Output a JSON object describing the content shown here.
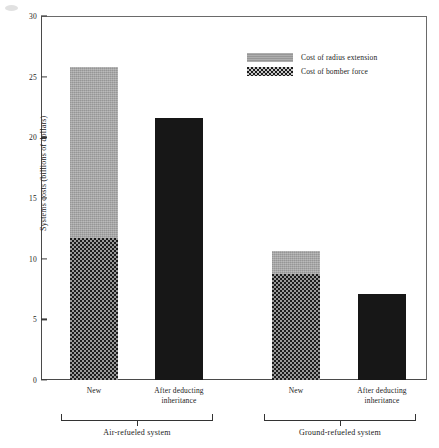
{
  "chart_data": {
    "type": "bar",
    "subtype": "stacked-grouped",
    "title": "",
    "xlabel": "",
    "ylabel": "Systems costs (billions of dollars)",
    "ylim": [
      0,
      30
    ],
    "yticks": [
      0,
      5,
      10,
      15,
      20,
      25,
      30
    ],
    "ytick_labels": [
      "0",
      "5",
      "10",
      "15",
      "20",
      "25",
      "30"
    ],
    "grid": false,
    "legend_position": "upper-center-right",
    "categories": [
      "New",
      "After deducting inheritance",
      "New",
      "After deducting inheritance"
    ],
    "groups": [
      {
        "label": "Air-refueled system",
        "bars": [
          {
            "category": "New",
            "bomber_force": 11.7,
            "radius_extension": 14.1,
            "total": 25.8
          },
          {
            "category": "After deducting inheritance",
            "bomber_force": 21.6,
            "radius_extension": 0.0,
            "total": 21.6
          }
        ]
      },
      {
        "label": "Ground-refueled system",
        "bars": [
          {
            "category": "New",
            "bomber_force": 8.7,
            "radius_extension": 1.9,
            "total": 10.6
          },
          {
            "category": "After deducting inheritance",
            "bomber_force": 7.1,
            "radius_extension": 0.0,
            "total": 7.1
          }
        ]
      }
    ],
    "series": [
      {
        "name": "Cost of bomber force",
        "values": [
          11.7,
          21.6,
          8.7,
          7.1
        ],
        "color": "#1c1c1c"
      },
      {
        "name": "Cost of radius extension",
        "values": [
          14.1,
          0.0,
          1.9,
          0.0
        ],
        "color": "#a6a6a6"
      }
    ],
    "legend": [
      {
        "label": "Cost of radius extension",
        "swatch": "radius",
        "color": "#a6a6a6"
      },
      {
        "label": "Cost of bomber force",
        "swatch": "bomber",
        "color": "#1c1c1c"
      }
    ]
  },
  "axis": {
    "y_title": "Systems costs (billions of dollars)",
    "y_ticks": [
      "0",
      "5",
      "10",
      "15",
      "20",
      "25",
      "30"
    ]
  },
  "x_labels": [
    {
      "line1": "New",
      "line2": ""
    },
    {
      "line1": "After deducting",
      "line2": "inheritance"
    },
    {
      "line1": "New",
      "line2": ""
    },
    {
      "line1": "After deducting",
      "line2": "inheritance"
    }
  ],
  "groups": [
    {
      "label": "Air-refueled system"
    },
    {
      "label": "Ground-refueled system"
    }
  ],
  "legend": {
    "items": [
      {
        "label": "Cost of radius extension"
      },
      {
        "label": "Cost of bomber force"
      }
    ]
  }
}
